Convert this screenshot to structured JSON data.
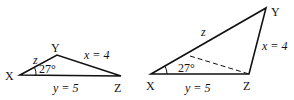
{
  "diagram": {
    "left_triangle": {
      "vertices": {
        "X": "X",
        "Y": "Y",
        "Z": "Z"
      },
      "angle_label": "27°",
      "side_z_label": "z",
      "side_x_label": "x = 4",
      "side_y_label": "y = 5",
      "points": {
        "X": [
          20,
          75
        ],
        "Y": [
          57,
          55
        ],
        "Z": [
          121,
          76
        ]
      }
    },
    "right_triangle": {
      "vertices": {
        "X": "X",
        "Y": "Y",
        "Z": "Z"
      },
      "angle_label": "27°",
      "side_z_label": "z",
      "side_x_label": "x = 4",
      "side_y_label": "y = 5",
      "points": {
        "X": [
          151,
          74
        ],
        "Y": [
          266,
          8
        ],
        "Z": [
          249,
          74
        ]
      },
      "dashed_segment": [
        [
          190,
          56
        ],
        [
          249,
          74
        ]
      ]
    },
    "stroke_color": "#111111",
    "background": "#ffffff"
  }
}
